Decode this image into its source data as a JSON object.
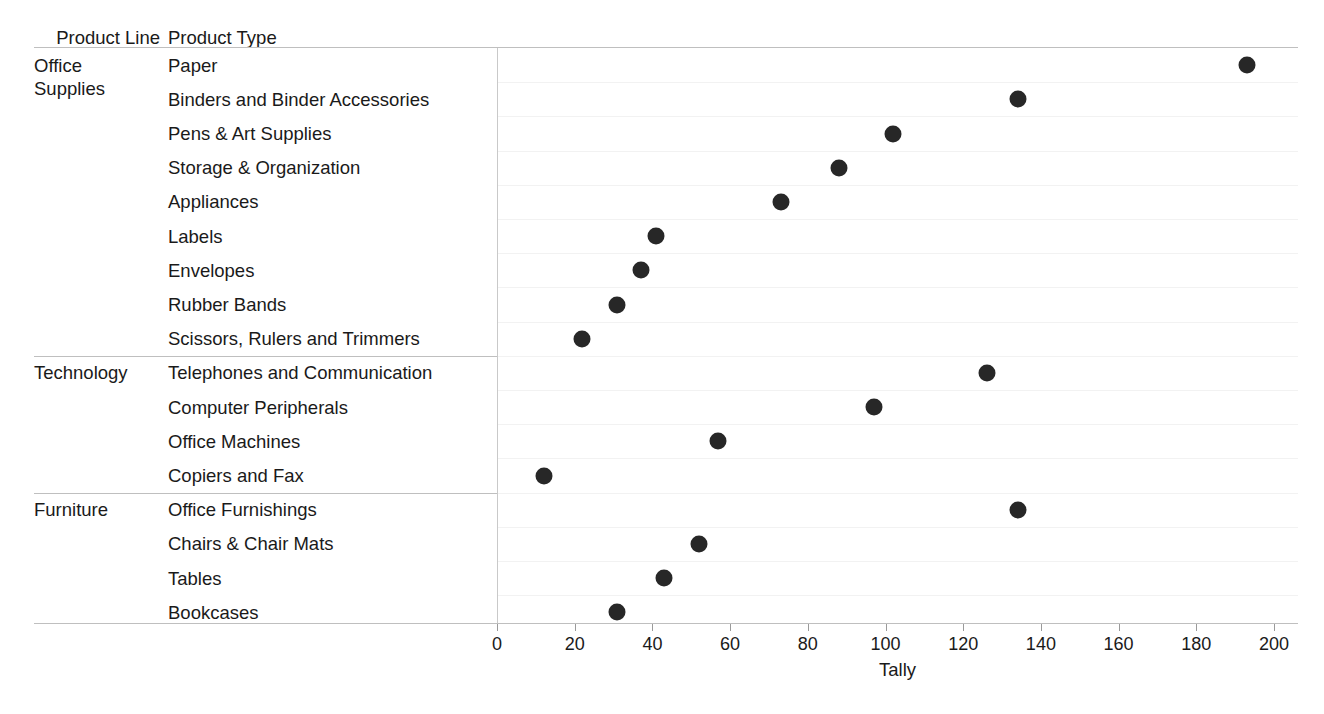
{
  "table_headers": {
    "product_line": "Product Line",
    "product_type": "Product Type"
  },
  "axis": {
    "title": "Tally",
    "ticks": [
      0,
      20,
      40,
      60,
      80,
      100,
      120,
      140,
      160,
      180,
      200
    ],
    "tick_labels": [
      "0",
      "20",
      "40",
      "60",
      "80",
      "100",
      "120",
      "140",
      "160",
      "180",
      "200"
    ]
  },
  "groups": [
    {
      "label": "Office\nSupplies",
      "display": "Office Supplies"
    },
    {
      "label": "Technology",
      "display": "Technology"
    },
    {
      "label": "Furniture",
      "display": "Furniture"
    }
  ],
  "rows": [
    {
      "group": "Office Supplies",
      "label": "Paper",
      "value": 193
    },
    {
      "group": "Office Supplies",
      "label": "Binders and Binder Accessories",
      "value": 134
    },
    {
      "group": "Office Supplies",
      "label": "Pens & Art Supplies",
      "value": 102
    },
    {
      "group": "Office Supplies",
      "label": "Storage & Organization",
      "value": 88
    },
    {
      "group": "Office Supplies",
      "label": "Appliances",
      "value": 73
    },
    {
      "group": "Office Supplies",
      "label": "Labels",
      "value": 41
    },
    {
      "group": "Office Supplies",
      "label": "Envelopes",
      "value": 37
    },
    {
      "group": "Office Supplies",
      "label": "Rubber Bands",
      "value": 31
    },
    {
      "group": "Office Supplies",
      "label": "Scissors, Rulers and Trimmers",
      "value": 22
    },
    {
      "group": "Technology",
      "label": "Telephones and Communication",
      "value": 126
    },
    {
      "group": "Technology",
      "label": "Computer Peripherals",
      "value": 97
    },
    {
      "group": "Technology",
      "label": "Office Machines",
      "value": 57
    },
    {
      "group": "Technology",
      "label": "Copiers and Fax",
      "value": 12
    },
    {
      "group": "Furniture",
      "label": "Office Furnishings",
      "value": 134
    },
    {
      "group": "Furniture",
      "label": "Chairs & Chair Mats",
      "value": 52
    },
    {
      "group": "Furniture",
      "label": "Tables",
      "value": 43
    },
    {
      "group": "Furniture",
      "label": "Bookcases",
      "value": 31
    }
  ],
  "colors": {
    "dot": "#272727",
    "rule": "#bfbfbf",
    "gridline": "#f2f2f2",
    "axis": "#c9c9c9",
    "text": "#1a1a1a",
    "background": "#ffffff"
  },
  "chart_data": {
    "type": "scatter",
    "title": "",
    "subtitle": "",
    "xlabel": "Tally",
    "ylabel": "",
    "xlim": [
      0,
      200
    ],
    "grid": true,
    "legend": "none",
    "orientation": "horizontal-dot-plot",
    "group_field": "Product Line",
    "category_field": "Product Type",
    "value_field": "Tally",
    "categories": [
      "Paper",
      "Binders and Binder Accessories",
      "Pens & Art Supplies",
      "Storage & Organization",
      "Appliances",
      "Labels",
      "Envelopes",
      "Rubber Bands",
      "Scissors, Rulers and Trimmers",
      "Telephones and Communication",
      "Computer Peripherals",
      "Office Machines",
      "Copiers and Fax",
      "Office Furnishings",
      "Chairs & Chair Mats",
      "Tables",
      "Bookcases"
    ],
    "values": [
      193,
      134,
      102,
      88,
      73,
      41,
      37,
      31,
      22,
      126,
      97,
      57,
      12,
      134,
      52,
      43,
      31
    ],
    "groups": [
      "Office Supplies",
      "Office Supplies",
      "Office Supplies",
      "Office Supplies",
      "Office Supplies",
      "Office Supplies",
      "Office Supplies",
      "Office Supplies",
      "Office Supplies",
      "Technology",
      "Technology",
      "Technology",
      "Technology",
      "Furniture",
      "Furniture",
      "Furniture",
      "Furniture"
    ],
    "xticks": [
      0,
      20,
      40,
      60,
      80,
      100,
      120,
      140,
      160,
      180,
      200
    ]
  }
}
